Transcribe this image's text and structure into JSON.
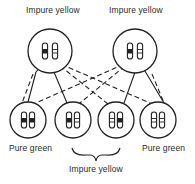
{
  "diagram": {
    "type": "genetic-cross",
    "parents": [
      {
        "id": "parent-left",
        "label": "Impure yellow",
        "cx": 50,
        "cy": 51,
        "r": 22,
        "chromosomes": [
          "dark-band",
          "light-band"
        ]
      },
      {
        "id": "parent-right",
        "label": "Impure yellow",
        "cx": 135,
        "cy": 51,
        "r": 22,
        "chromosomes": [
          "dark-band",
          "light-band"
        ]
      }
    ],
    "offspring": [
      {
        "id": "child-1",
        "cx": 28,
        "cy": 120,
        "r": 18,
        "chromosomes": [
          "dark-band",
          "dark-band"
        ]
      },
      {
        "id": "child-2",
        "cx": 73,
        "cy": 120,
        "r": 18,
        "chromosomes": [
          "dark-band",
          "light-band"
        ]
      },
      {
        "id": "child-3",
        "cx": 116,
        "cy": 120,
        "r": 18,
        "chromosomes": [
          "light-band",
          "dark-band"
        ]
      },
      {
        "id": "child-4",
        "cx": 158,
        "cy": 120,
        "r": 18,
        "chromosomes": [
          "light-band",
          "light-band"
        ]
      }
    ],
    "labels": {
      "parent_left": "Impure yellow",
      "parent_right": "Impure yellow",
      "child_left": "Pure green",
      "child_right": "Pure green",
      "children_middle": "Impure yellow"
    },
    "colors": {
      "ink": "#222222",
      "background": "#ffffff"
    }
  }
}
